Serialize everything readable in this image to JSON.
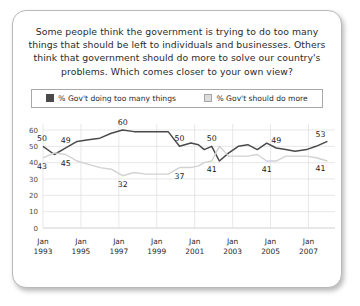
{
  "question": "Some people think the government is trying to do too many things that should be left to individuals and businesses. Others think that government should do more to solve our country's problems. Which comes closer to your own view?",
  "legend": {
    "series1_label": "% Gov't doing too many things",
    "series1_color": "#4a4a4a",
    "series2_label": "% Gov't should do more",
    "series2_color": "#dcdcdc"
  },
  "chart_data": {
    "type": "line",
    "title": "Some people think the government is trying to do too many things that should be left to individuals and businesses. Others think that government should do more to solve our country's problems. Which comes closer to your own view?",
    "xlabel": "",
    "ylabel": "",
    "ylim": [
      0,
      60
    ],
    "yticks": [
      0,
      10,
      20,
      30,
      40,
      50,
      60
    ],
    "grid": true,
    "legend_position": "top",
    "xtick_labels": [
      "Jan\n1993",
      "Jan\n1995",
      "Jan\n1997",
      "Jan\n1999",
      "Jan\n2001",
      "Jan\n2003",
      "Jan\n2005",
      "Jan\n2007"
    ],
    "xticks_top": [
      "Jan",
      "Jan",
      "Jan",
      "Jan",
      "Jan",
      "Jan",
      "Jan",
      "Jan"
    ],
    "xticks_bottom": [
      "1993",
      "1995",
      "1997",
      "1999",
      "2001",
      "2003",
      "2005",
      "2007"
    ],
    "x": [
      1993.0,
      1993.6,
      1994.2,
      1994.8,
      1995.4,
      1996.0,
      1996.6,
      1997.2,
      1997.8,
      1998.4,
      1999.0,
      1999.6,
      2000.2,
      2000.8,
      2001.2,
      2001.5,
      2001.9,
      2002.3,
      2002.8,
      2003.3,
      2003.8,
      2004.3,
      2004.8,
      2005.3,
      2005.8,
      2006.3,
      2006.9,
      2007.4,
      2008.0
    ],
    "series": [
      {
        "name": "% Gov't doing too many things",
        "color": "#4a4a4a",
        "values": [
          50,
          45,
          49,
          53,
          54,
          55,
          58,
          60,
          59,
          59,
          59,
          59,
          50,
          52,
          51,
          48,
          50,
          41,
          46,
          50,
          51,
          48,
          52,
          49,
          48,
          47,
          48,
          50,
          53
        ],
        "point_labels": [
          {
            "x": 1993.0,
            "value": 50,
            "text": "50"
          },
          {
            "x": 1994.2,
            "value": 49,
            "text": "49"
          },
          {
            "x": 1997.2,
            "value": 60,
            "text": "60"
          },
          {
            "x": 2000.2,
            "value": 50,
            "text": "50"
          },
          {
            "x": 2001.9,
            "value": 50,
            "text": "50"
          },
          {
            "x": 2005.3,
            "value": 49,
            "text": "49"
          },
          {
            "x": 2008.0,
            "value": 53,
            "text": "53"
          }
        ]
      },
      {
        "name": "% Gov't should do more",
        "color": "#d2d2d2",
        "values": [
          43,
          46,
          45,
          41,
          39,
          37,
          36,
          32,
          34,
          33,
          33,
          33,
          37,
          37,
          38,
          40,
          41,
          50,
          44,
          44,
          44,
          45,
          41,
          41,
          44,
          44,
          44,
          43,
          41
        ],
        "point_labels": [
          {
            "x": 1993.0,
            "value": 43,
            "text": "43"
          },
          {
            "x": 1994.2,
            "value": 45,
            "text": "45"
          },
          {
            "x": 1997.2,
            "value": 32,
            "text": "32"
          },
          {
            "x": 2000.2,
            "value": 37,
            "text": "37"
          },
          {
            "x": 2001.9,
            "value": 41,
            "text": "41"
          },
          {
            "x": 2004.8,
            "value": 41,
            "text": "41"
          },
          {
            "x": 2008.0,
            "value": 41,
            "text": "41"
          }
        ]
      }
    ]
  }
}
